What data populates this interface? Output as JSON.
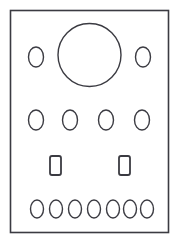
{
  "drawing": {
    "title": "Panel Hole Layout",
    "type": "technical-line-drawing",
    "canvas": {
      "width": 179,
      "height": 244,
      "background": "#ffffff"
    },
    "stroke": {
      "color": "#3b3b42",
      "panel_width": 1.6,
      "feature_width": 1.4,
      "slot_width": 1.8
    },
    "panel": {
      "name": "panel-outline",
      "shape": "rectangle",
      "x": 10.5,
      "y": 10.5,
      "width": 158,
      "height": 222
    },
    "features": [
      {
        "name": "large-center-hole",
        "shape": "circle",
        "cx": 89.5,
        "cy": 55,
        "r": 31.5,
        "row": "row-1"
      },
      {
        "name": "oval-row1-left",
        "shape": "ellipse",
        "cx": 36,
        "cy": 57,
        "rx": 7.5,
        "ry": 10,
        "row": "row-1"
      },
      {
        "name": "oval-row1-right",
        "shape": "ellipse",
        "cx": 143,
        "cy": 57,
        "rx": 7.5,
        "ry": 10,
        "row": "row-1"
      },
      {
        "name": "oval-row2-1",
        "shape": "ellipse",
        "cx": 36,
        "cy": 120,
        "rx": 7.5,
        "ry": 10,
        "row": "row-2"
      },
      {
        "name": "oval-row2-2",
        "shape": "ellipse",
        "cx": 70,
        "cy": 120,
        "rx": 7.5,
        "ry": 10,
        "row": "row-2"
      },
      {
        "name": "oval-row2-3",
        "shape": "ellipse",
        "cx": 106,
        "cy": 120,
        "rx": 7.5,
        "ry": 10,
        "row": "row-2"
      },
      {
        "name": "oval-row2-4",
        "shape": "ellipse",
        "cx": 142,
        "cy": 120,
        "rx": 7.5,
        "ry": 10,
        "row": "row-2"
      },
      {
        "name": "slot-left",
        "shape": "rounded-rect",
        "x": 50,
        "y": 156,
        "width": 11,
        "height": 19,
        "rx": 2,
        "row": "row-3"
      },
      {
        "name": "slot-right",
        "shape": "rounded-rect",
        "x": 119,
        "y": 156,
        "width": 11,
        "height": 19,
        "rx": 2,
        "row": "row-3"
      },
      {
        "name": "oval-row4-1",
        "shape": "ellipse",
        "cx": 37,
        "cy": 209,
        "rx": 6.5,
        "ry": 9,
        "row": "row-4"
      },
      {
        "name": "oval-row4-2",
        "shape": "ellipse",
        "cx": 56,
        "cy": 209,
        "rx": 6.5,
        "ry": 9,
        "row": "row-4"
      },
      {
        "name": "oval-row4-3",
        "shape": "ellipse",
        "cx": 75,
        "cy": 209,
        "rx": 6.5,
        "ry": 9,
        "row": "row-4"
      },
      {
        "name": "oval-row4-4",
        "shape": "ellipse",
        "cx": 94,
        "cy": 209,
        "rx": 6.5,
        "ry": 9,
        "row": "row-4"
      },
      {
        "name": "oval-row4-5",
        "shape": "ellipse",
        "cx": 113,
        "cy": 209,
        "rx": 6.5,
        "ry": 9,
        "row": "row-4"
      },
      {
        "name": "oval-row4-6",
        "shape": "ellipse",
        "cx": 130,
        "cy": 209,
        "rx": 6.5,
        "ry": 9,
        "row": "row-4"
      },
      {
        "name": "oval-row4-7",
        "shape": "ellipse",
        "cx": 147,
        "cy": 209,
        "rx": 6.5,
        "ry": 9,
        "row": "row-4"
      }
    ]
  }
}
